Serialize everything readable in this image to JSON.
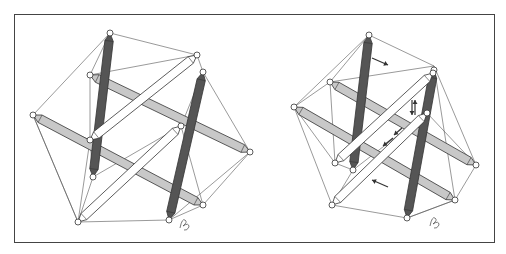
{
  "figure": {
    "title": "",
    "panels": [
      {
        "id": "left",
        "description": "Six-strut tensegrity icosahedron at rest",
        "struts": [
          {
            "shade": "dark",
            "x1": 110,
            "y1": 33,
            "x2": 93,
            "y2": 177
          },
          {
            "shade": "dark",
            "x1": 203,
            "y1": 72,
            "x2": 169,
            "y2": 220
          },
          {
            "shade": "gray",
            "x1": 90,
            "y1": 75,
            "x2": 250,
            "y2": 152
          },
          {
            "shade": "gray",
            "x1": 33,
            "y1": 115,
            "x2": 203,
            "y2": 205
          },
          {
            "shade": "white",
            "x1": 197,
            "y1": 55,
            "x2": 90,
            "y2": 140
          },
          {
            "shade": "white",
            "x1": 181,
            "y1": 126,
            "x2": 78,
            "y2": 222
          }
        ],
        "cables": [
          [
            110,
            33,
            197,
            55
          ],
          [
            110,
            33,
            90,
            75
          ],
          [
            110,
            33,
            33,
            115
          ],
          [
            197,
            55,
            203,
            72
          ],
          [
            197,
            55,
            90,
            75
          ],
          [
            203,
            72,
            250,
            152
          ],
          [
            203,
            72,
            181,
            126
          ],
          [
            250,
            152,
            203,
            205
          ],
          [
            250,
            152,
            169,
            220
          ],
          [
            203,
            205,
            169,
            220
          ],
          [
            169,
            220,
            78,
            222
          ],
          [
            78,
            222,
            33,
            115
          ],
          [
            78,
            222,
            93,
            177
          ],
          [
            33,
            115,
            90,
            140
          ],
          [
            93,
            177,
            90,
            140
          ],
          [
            93,
            177,
            181,
            126
          ],
          [
            90,
            75,
            90,
            140
          ],
          [
            181,
            126,
            203,
            205
          ],
          [
            33,
            115,
            78,
            222
          ],
          [
            90,
            140,
            78,
            222
          ]
        ],
        "signature": {
          "x": 180,
          "y": 220
        }
      },
      {
        "id": "right",
        "description": "Tensegrity icosahedron under load with force arrows",
        "struts": [
          {
            "shade": "dark",
            "x1": 369,
            "y1": 35,
            "x2": 353,
            "y2": 170
          },
          {
            "shade": "dark",
            "x1": 434,
            "y1": 70,
            "x2": 407,
            "y2": 218
          },
          {
            "shade": "gray",
            "x1": 330,
            "y1": 82,
            "x2": 476,
            "y2": 165
          },
          {
            "shade": "gray",
            "x1": 294,
            "y1": 107,
            "x2": 455,
            "y2": 200
          },
          {
            "shade": "white",
            "x1": 433,
            "y1": 73,
            "x2": 335,
            "y2": 163
          },
          {
            "shade": "white",
            "x1": 427,
            "y1": 113,
            "x2": 332,
            "y2": 205
          }
        ],
        "cables": [
          [
            369,
            35,
            434,
            66
          ],
          [
            369,
            35,
            330,
            82
          ],
          [
            369,
            35,
            294,
            107
          ],
          [
            434,
            66,
            330,
            82
          ],
          [
            434,
            66,
            476,
            165
          ],
          [
            434,
            66,
            455,
            200
          ],
          [
            476,
            165,
            455,
            200
          ],
          [
            455,
            200,
            407,
            218
          ],
          [
            407,
            218,
            332,
            205
          ],
          [
            332,
            205,
            294,
            107
          ],
          [
            294,
            107,
            335,
            163
          ],
          [
            330,
            82,
            335,
            163
          ],
          [
            353,
            170,
            335,
            163
          ],
          [
            353,
            170,
            427,
            113
          ],
          [
            427,
            113,
            476,
            165
          ],
          [
            332,
            205,
            353,
            170
          ],
          [
            407,
            218,
            455,
            200
          ],
          [
            294,
            107,
            330,
            82
          ]
        ],
        "arrows": [
          {
            "x1": 372,
            "y1": 58,
            "x2": 388,
            "y2": 65
          },
          {
            "x1": 388,
            "y1": 187,
            "x2": 372,
            "y2": 180
          },
          {
            "x1": 412,
            "y1": 100,
            "x2": 412,
            "y2": 115
          },
          {
            "x1": 415,
            "y1": 115,
            "x2": 415,
            "y2": 100
          },
          {
            "x1": 393,
            "y1": 138,
            "x2": 383,
            "y2": 146
          },
          {
            "x1": 402,
            "y1": 128,
            "x2": 394,
            "y2": 135
          }
        ],
        "signature": {
          "x": 430,
          "y": 218
        }
      }
    ],
    "colors": {
      "dark_strut": "#555555",
      "gray_strut": "#c8c8c8",
      "white_strut": "#ffffff",
      "outline": "#333333",
      "frame": "#444444"
    }
  }
}
